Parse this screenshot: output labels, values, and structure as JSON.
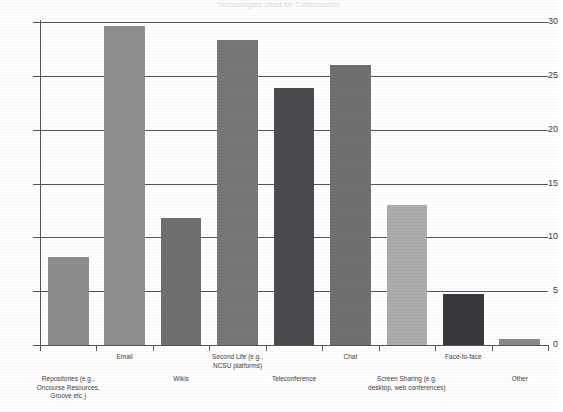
{
  "chart_data": {
    "type": "bar",
    "title": "Technologies Used for Collaboration",
    "xlabel": "",
    "ylabel": "",
    "ylim": [
      0,
      30
    ],
    "yticks": [
      0,
      5,
      10,
      15,
      20,
      25,
      30
    ],
    "ytick_labels": [
      "0",
      "5",
      "10",
      "15",
      "20",
      "25",
      "30"
    ],
    "grid": true,
    "legend": "none",
    "categories": [
      "Repositories (e.g.,\nOncourse Resources,\nGroove etc.)",
      "Email",
      "Wikis",
      "Second Life (e.g.,\nNCSU platforms)",
      "Teleconference",
      "Chat",
      "Screen Sharing (e.g.\ndesktop, web conferences)",
      "Face-to-face",
      "Other"
    ],
    "values": [
      8.2,
      29.6,
      11.8,
      28.3,
      23.9,
      26.0,
      13.0,
      4.7,
      0.6
    ],
    "bar_colors": [
      "#8d8d8d",
      "#8f8f8f",
      "#6f6f70",
      "#77777a",
      "#4b4b4f",
      "#707073",
      "#acacad",
      "#39393d",
      "#8a8a8c"
    ]
  },
  "axis": {
    "line_color": "#55555a",
    "grid_color": "#55555a"
  }
}
